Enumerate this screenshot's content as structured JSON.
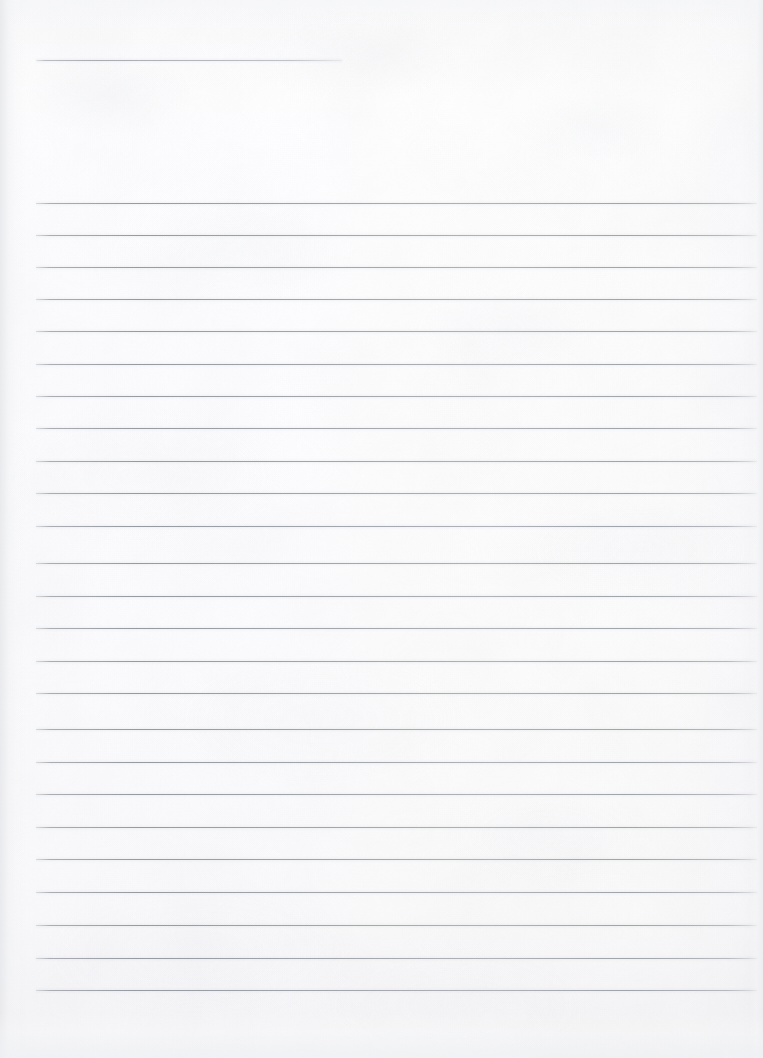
{
  "document": {
    "kind": "scanned-blank-lined-notebook-page",
    "page_width": 763,
    "page_height": 1058,
    "title_text": "",
    "body_text": "",
    "has_handwriting": false,
    "has_printed_text": false,
    "orientation": "portrait"
  },
  "paper": {
    "base_color": "#fdfdfd",
    "highlight_color": "#ffffff",
    "shadow_color": "#f2f3f5",
    "grain_color": "#eeeff2",
    "edge_shadow_color": "#e8e9ec"
  },
  "ruling": {
    "line_color": "#9aa0a7",
    "line_color_light": "#c4c7cb",
    "line_thickness_px": 1,
    "line_spacing_px": 32.4,
    "left_margin_px": 36,
    "right_end_px": 757,
    "header_rule": {
      "label": "title-rule",
      "y": 60,
      "x_start": 36,
      "x_end": 342
    },
    "body_rules": [
      {
        "label": "rule-1",
        "y": 202.5,
        "x_start": 36,
        "x_end": 757
      },
      {
        "label": "rule-2",
        "y": 234.5,
        "x_start": 36,
        "x_end": 757
      },
      {
        "label": "rule-3",
        "y": 266.5,
        "x_start": 36,
        "x_end": 757
      },
      {
        "label": "rule-4",
        "y": 299.0,
        "x_start": 36,
        "x_end": 757
      },
      {
        "label": "rule-5",
        "y": 331.0,
        "x_start": 36,
        "x_end": 757
      },
      {
        "label": "rule-6",
        "y": 363.5,
        "x_start": 36,
        "x_end": 757
      },
      {
        "label": "rule-7",
        "y": 396.0,
        "x_start": 36,
        "x_end": 757
      },
      {
        "label": "rule-8",
        "y": 428.0,
        "x_start": 36,
        "x_end": 757
      },
      {
        "label": "rule-9",
        "y": 460.5,
        "x_start": 36,
        "x_end": 757
      },
      {
        "label": "rule-10",
        "y": 493.0,
        "x_start": 36,
        "x_end": 757
      },
      {
        "label": "rule-11",
        "y": 525.5,
        "x_start": 36,
        "x_end": 757
      },
      {
        "label": "rule-12",
        "y": 563.0,
        "x_start": 36,
        "x_end": 757
      },
      {
        "label": "rule-13",
        "y": 595.5,
        "x_start": 36,
        "x_end": 757
      },
      {
        "label": "rule-14",
        "y": 628.0,
        "x_start": 36,
        "x_end": 757
      },
      {
        "label": "rule-15",
        "y": 660.5,
        "x_start": 36,
        "x_end": 757
      },
      {
        "label": "rule-16",
        "y": 693.0,
        "x_start": 36,
        "x_end": 757
      },
      {
        "label": "rule-17",
        "y": 729.0,
        "x_start": 36,
        "x_end": 757
      },
      {
        "label": "rule-18",
        "y": 761.5,
        "x_start": 36,
        "x_end": 757
      },
      {
        "label": "rule-19",
        "y": 794.0,
        "x_start": 36,
        "x_end": 757
      },
      {
        "label": "rule-20",
        "y": 826.5,
        "x_start": 36,
        "x_end": 757
      },
      {
        "label": "rule-21",
        "y": 859.0,
        "x_start": 36,
        "x_end": 757
      },
      {
        "label": "rule-22",
        "y": 891.5,
        "x_start": 36,
        "x_end": 757
      },
      {
        "label": "rule-23",
        "y": 925.0,
        "x_start": 36,
        "x_end": 757
      },
      {
        "label": "rule-24",
        "y": 958.0,
        "x_start": 36,
        "x_end": 757
      },
      {
        "label": "rule-25",
        "y": 990.0,
        "x_start": 36,
        "x_end": 757
      }
    ]
  }
}
